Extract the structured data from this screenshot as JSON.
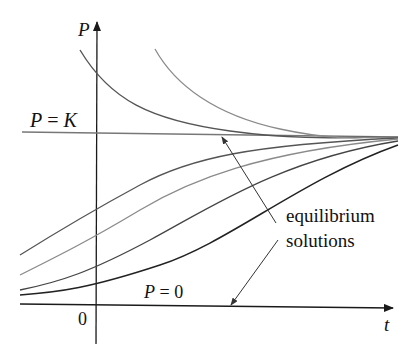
{
  "diagram": {
    "axes": {
      "y_label": "P",
      "x_label": "t",
      "origin_label": "0"
    },
    "equilibrium_lines": [
      {
        "label": "P = K",
        "label_parts": [
          "P",
          " = ",
          "K"
        ]
      },
      {
        "label": "P = 0",
        "label_parts": [
          "P",
          " = ",
          "0"
        ]
      }
    ],
    "annotation": {
      "line1": "equilibrium",
      "line2": "solutions"
    },
    "colors": {
      "axis": "#1a1a1a",
      "curve_dark": "#222222",
      "curve_mid": "#555555",
      "curve_light": "#8a8a8a",
      "k_line": "#777777"
    }
  }
}
